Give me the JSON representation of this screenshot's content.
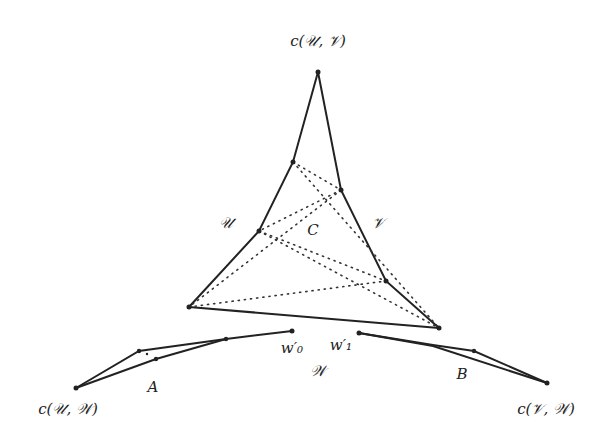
{
  "diagram": {
    "labels": {
      "top_vertex": "c(𝒰, 𝒱)",
      "left_side": "𝒰",
      "center": "C",
      "right_side": "𝒱",
      "w0": "w′₀",
      "w1": "w′₁",
      "bottom": "𝒲",
      "region_a": "A",
      "region_b": "B",
      "bottom_left_vertex": "c(𝒰, 𝒲)",
      "bottom_right_vertex": "c(𝒱, 𝒲)"
    }
  }
}
